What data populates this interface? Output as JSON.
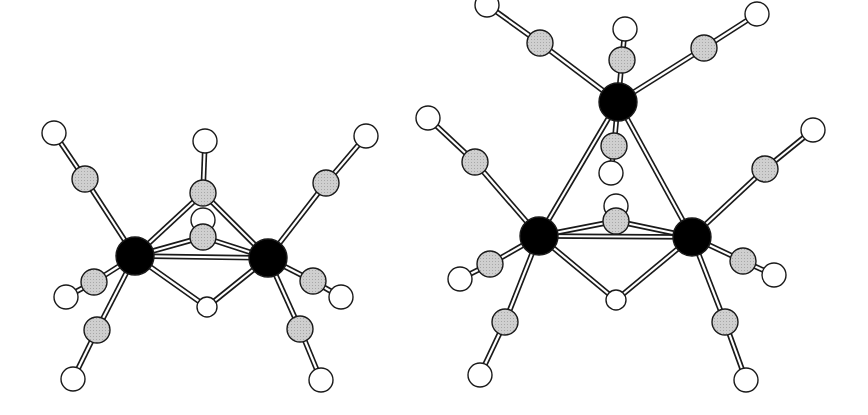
{
  "figure": {
    "width": 868,
    "height": 415,
    "colors": {
      "background": "#ffffff",
      "metal": "#000000",
      "carbon": "#c8c8c8",
      "oxygen": "#ffffff",
      "hydrogen": "#ffffff",
      "outline": "#1a1a1a"
    },
    "atom_radii": {
      "metal": 19,
      "carbon": 13,
      "oxygen": 12,
      "hydrogen": 10
    }
  },
  "molecules": [
    {
      "id": "left-dinuclear-cluster",
      "atoms": [
        {
          "id": "M1",
          "type": "metal",
          "x": 135,
          "y": 256
        },
        {
          "id": "M2",
          "type": "metal",
          "x": 268,
          "y": 258
        },
        {
          "id": "Cb1",
          "type": "carbon",
          "x": 203,
          "y": 193
        },
        {
          "id": "Ob1",
          "type": "oxygen",
          "x": 205,
          "y": 141
        },
        {
          "id": "Ob2",
          "type": "oxygen",
          "x": 203,
          "y": 220
        },
        {
          "id": "Cb2",
          "type": "carbon",
          "x": 203,
          "y": 237
        },
        {
          "id": "H1",
          "type": "hydrogen",
          "x": 207,
          "y": 307
        },
        {
          "id": "C1",
          "type": "carbon",
          "x": 85,
          "y": 179
        },
        {
          "id": "O1",
          "type": "oxygen",
          "x": 54,
          "y": 133
        },
        {
          "id": "C2",
          "type": "carbon",
          "x": 94,
          "y": 282
        },
        {
          "id": "O2",
          "type": "oxygen",
          "x": 66,
          "y": 297
        },
        {
          "id": "C3",
          "type": "carbon",
          "x": 97,
          "y": 330
        },
        {
          "id": "O3",
          "type": "oxygen",
          "x": 73,
          "y": 379
        },
        {
          "id": "C4",
          "type": "carbon",
          "x": 326,
          "y": 183
        },
        {
          "id": "O4",
          "type": "oxygen",
          "x": 366,
          "y": 136
        },
        {
          "id": "C5",
          "type": "carbon",
          "x": 313,
          "y": 281
        },
        {
          "id": "O5",
          "type": "oxygen",
          "x": 341,
          "y": 297
        },
        {
          "id": "C6",
          "type": "carbon",
          "x": 300,
          "y": 329
        },
        {
          "id": "O6",
          "type": "oxygen",
          "x": 321,
          "y": 380
        }
      ],
      "bonds": [
        [
          "M1",
          "C1"
        ],
        [
          "C1",
          "O1"
        ],
        [
          "M1",
          "C2"
        ],
        [
          "C2",
          "O2"
        ],
        [
          "M1",
          "C3"
        ],
        [
          "C3",
          "O3"
        ],
        [
          "M2",
          "C4"
        ],
        [
          "C4",
          "O4"
        ],
        [
          "M2",
          "C5"
        ],
        [
          "C5",
          "O5"
        ],
        [
          "M2",
          "C6"
        ],
        [
          "C6",
          "O6"
        ],
        [
          "M1",
          "Cb1"
        ],
        [
          "M2",
          "Cb1"
        ],
        [
          "Cb1",
          "Ob1"
        ],
        [
          "M1",
          "Cb2"
        ],
        [
          "M2",
          "Cb2"
        ],
        [
          "M1",
          "M2"
        ],
        [
          "M1",
          "H1"
        ],
        [
          "M2",
          "H1"
        ]
      ],
      "draw_order": [
        "Ob2",
        "Cb2",
        "Ob1",
        "Cb1",
        "H1",
        "M1",
        "M2",
        "O1",
        "C1",
        "O2",
        "C2",
        "O3",
        "C3",
        "O4",
        "C4",
        "O5",
        "C5",
        "O6",
        "C6"
      ]
    },
    {
      "id": "right-trinuclear-cluster",
      "atoms": [
        {
          "id": "Mt",
          "type": "metal",
          "x": 618,
          "y": 102
        },
        {
          "id": "Ml",
          "type": "metal",
          "x": 539,
          "y": 236
        },
        {
          "id": "Mr",
          "type": "metal",
          "x": 692,
          "y": 237
        },
        {
          "id": "Ct1",
          "type": "carbon",
          "x": 622,
          "y": 60
        },
        {
          "id": "Ot1",
          "type": "oxygen",
          "x": 625,
          "y": 29
        },
        {
          "id": "Ct2",
          "type": "carbon",
          "x": 540,
          "y": 43
        },
        {
          "id": "Ot2",
          "type": "oxygen",
          "x": 487,
          "y": 5
        },
        {
          "id": "Ct3",
          "type": "carbon",
          "x": 704,
          "y": 48
        },
        {
          "id": "Ot3",
          "type": "oxygen",
          "x": 757,
          "y": 14
        },
        {
          "id": "Ct4",
          "type": "carbon",
          "x": 614,
          "y": 146
        },
        {
          "id": "Ot4",
          "type": "oxygen",
          "x": 611,
          "y": 173
        },
        {
          "id": "Ob",
          "type": "oxygen",
          "x": 616,
          "y": 206
        },
        {
          "id": "Cb",
          "type": "carbon",
          "x": 616,
          "y": 221
        },
        {
          "id": "Hb",
          "type": "hydrogen",
          "x": 616,
          "y": 300
        },
        {
          "id": "Cl1",
          "type": "carbon",
          "x": 475,
          "y": 162
        },
        {
          "id": "Ol1",
          "type": "oxygen",
          "x": 428,
          "y": 118
        },
        {
          "id": "Cl2",
          "type": "carbon",
          "x": 490,
          "y": 264
        },
        {
          "id": "Ol2",
          "type": "oxygen",
          "x": 460,
          "y": 279
        },
        {
          "id": "Cl3",
          "type": "carbon",
          "x": 505,
          "y": 322
        },
        {
          "id": "Ol3",
          "type": "oxygen",
          "x": 480,
          "y": 375
        },
        {
          "id": "Cr1",
          "type": "carbon",
          "x": 765,
          "y": 169
        },
        {
          "id": "Or1",
          "type": "oxygen",
          "x": 813,
          "y": 130
        },
        {
          "id": "Cr2",
          "type": "carbon",
          "x": 743,
          "y": 261
        },
        {
          "id": "Or2",
          "type": "oxygen",
          "x": 774,
          "y": 275
        },
        {
          "id": "Cr3",
          "type": "carbon",
          "x": 725,
          "y": 322
        },
        {
          "id": "Or3",
          "type": "oxygen",
          "x": 746,
          "y": 380
        }
      ],
      "bonds": [
        [
          "Mt",
          "Ct1"
        ],
        [
          "Ct1",
          "Ot1"
        ],
        [
          "Mt",
          "Ct2"
        ],
        [
          "Ct2",
          "Ot2"
        ],
        [
          "Mt",
          "Ct3"
        ],
        [
          "Ct3",
          "Ot3"
        ],
        [
          "Mt",
          "Ct4"
        ],
        [
          "Ct4",
          "Ot4"
        ],
        [
          "Mt",
          "Ml"
        ],
        [
          "Mt",
          "Mr"
        ],
        [
          "Ml",
          "Mr"
        ],
        [
          "Ml",
          "Cb"
        ],
        [
          "Mr",
          "Cb"
        ],
        [
          "Ml",
          "Hb"
        ],
        [
          "Mr",
          "Hb"
        ],
        [
          "Ml",
          "Cl1"
        ],
        [
          "Cl1",
          "Ol1"
        ],
        [
          "Ml",
          "Cl2"
        ],
        [
          "Cl2",
          "Ol2"
        ],
        [
          "Ml",
          "Cl3"
        ],
        [
          "Cl3",
          "Ol3"
        ],
        [
          "Mr",
          "Cr1"
        ],
        [
          "Cr1",
          "Or1"
        ],
        [
          "Mr",
          "Cr2"
        ],
        [
          "Cr2",
          "Or2"
        ],
        [
          "Mr",
          "Cr3"
        ],
        [
          "Cr3",
          "Or3"
        ]
      ],
      "draw_order": [
        "Ot1",
        "Ct1",
        "Ot4",
        "Ct4",
        "Mt",
        "Ot2",
        "Ct2",
        "Ot3",
        "Ct3",
        "Ob",
        "Cb",
        "Hb",
        "Ol1",
        "Cl1",
        "Ol2",
        "Cl2",
        "Ml",
        "Ol3",
        "Cl3",
        "Or1",
        "Cr1",
        "Mr",
        "Or2",
        "Cr2",
        "Or3",
        "Cr3"
      ]
    }
  ]
}
